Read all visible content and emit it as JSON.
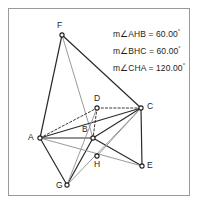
{
  "figure": {
    "frame": {
      "x": 8,
      "y": 8,
      "width": 182,
      "height": 188,
      "border_color": "#9a9a9a"
    },
    "colors": {
      "dark_stroke": "#2b2b2b",
      "gray_stroke": "#8f8f8f",
      "dashed_stroke": "#3a3a3a",
      "point_fill": "#ffffff",
      "point_stroke": "#1d1d1d",
      "text": "#1d1d1d",
      "background": "#ffffff"
    },
    "points": [
      {
        "id": "F",
        "label": "F",
        "x": 62,
        "y": 35,
        "label_x": 57,
        "label_y": 20
      },
      {
        "id": "D",
        "label": "D",
        "x": 97,
        "y": 108,
        "label_x": 94,
        "label_y": 93
      },
      {
        "id": "C",
        "label": "C",
        "x": 141,
        "y": 108,
        "label_x": 147,
        "label_y": 101
      },
      {
        "id": "A",
        "label": "A",
        "x": 40,
        "y": 138,
        "label_x": 28,
        "label_y": 132
      },
      {
        "id": "B",
        "label": "B",
        "x": 93,
        "y": 138,
        "label_x": 82,
        "label_y": 124
      },
      {
        "id": "H",
        "label": "H",
        "x": 97,
        "y": 156,
        "label_x": 94,
        "label_y": 159
      },
      {
        "id": "E",
        "label": "E",
        "x": 142,
        "y": 166,
        "label_x": 147,
        "label_y": 160
      },
      {
        "id": "G",
        "label": "G",
        "x": 67,
        "y": 185,
        "label_x": 56,
        "label_y": 180
      }
    ],
    "segments": [
      {
        "from": "F",
        "to": "A",
        "style": "solid",
        "color": "dark"
      },
      {
        "from": "F",
        "to": "C",
        "style": "solid",
        "color": "dark"
      },
      {
        "from": "F",
        "to": "B",
        "style": "solid",
        "color": "gray"
      },
      {
        "from": "A",
        "to": "D",
        "style": "dashed",
        "color": "dashed"
      },
      {
        "from": "D",
        "to": "C",
        "style": "dashed",
        "color": "dashed"
      },
      {
        "from": "D",
        "to": "B",
        "style": "dashed",
        "color": "dashed"
      },
      {
        "from": "A",
        "to": "C",
        "style": "solid",
        "color": "dark"
      },
      {
        "from": "A",
        "to": "B",
        "style": "solid",
        "color": "dark"
      },
      {
        "from": "B",
        "to": "C",
        "style": "solid",
        "color": "dark"
      },
      {
        "from": "A",
        "to": "G",
        "style": "solid",
        "color": "dark"
      },
      {
        "from": "G",
        "to": "B",
        "style": "solid",
        "color": "dark"
      },
      {
        "from": "B",
        "to": "E",
        "style": "solid",
        "color": "dark"
      },
      {
        "from": "C",
        "to": "E",
        "style": "solid",
        "color": "dark"
      },
      {
        "from": "A",
        "to": "E",
        "style": "solid",
        "color": "gray"
      },
      {
        "from": "G",
        "to": "C",
        "style": "solid",
        "color": "gray"
      },
      {
        "from": "H",
        "to": "C",
        "style": "solid",
        "color": "gray"
      },
      {
        "from": "G",
        "to": "D",
        "style": "solid",
        "color": "gray"
      }
    ],
    "measurements": [
      {
        "id": "angle-AHB",
        "text": "m∠AHB = 60.00",
        "unit": "°",
        "x": 113,
        "y": 28
      },
      {
        "id": "angle-BHC",
        "text": "m∠BHC = 60.00",
        "unit": "°",
        "x": 113,
        "y": 45
      },
      {
        "id": "angle-CHA",
        "text": "m∠CHA = 120.00",
        "unit": "°",
        "x": 113,
        "y": 62
      }
    ]
  }
}
